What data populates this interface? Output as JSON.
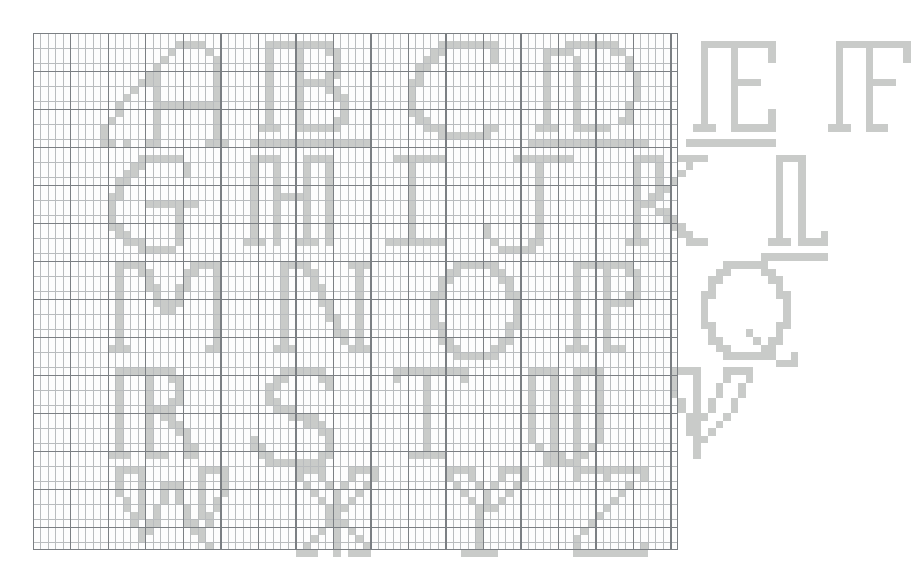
{
  "document": {
    "kind": "filet-crochet-alphabet-chart",
    "title": "Alphabet Chart A-Z",
    "description": "Graph-paper chart of decorative serif capital letters A through Z laid out in five rows",
    "paper_color": "#ffffff",
    "grid_background": "#fdfdfd",
    "minor_line_color": "#b9bcbe",
    "major_line_color": "#7b7f83",
    "filled_cell_color": "#c9cbc9",
    "cell_width_px": 7.5,
    "cell_height_px": 7.6,
    "major_every_n_cells": 5,
    "columns": 86,
    "rows": 68,
    "grid_origin": {
      "x": 33,
      "y": 33
    },
    "grid_size": {
      "width": 645,
      "height": 517
    }
  },
  "alphabet": {
    "letters": [
      "A",
      "B",
      "C",
      "D",
      "E",
      "F",
      "G",
      "H",
      "I",
      "J",
      "K",
      "L",
      "M",
      "N",
      "O",
      "P",
      "Q",
      "R",
      "S",
      "T",
      "U",
      "V",
      "W",
      "X",
      "Y",
      "Z"
    ],
    "rows": [
      {
        "index": 1,
        "letters": [
          "A",
          "B",
          "C",
          "D",
          "E",
          "F"
        ]
      },
      {
        "index": 2,
        "letters": [
          "G",
          "H",
          "I",
          "J",
          "K",
          "L"
        ]
      },
      {
        "index": 3,
        "letters": [
          "M",
          "N",
          "O",
          "P",
          "Q"
        ]
      },
      {
        "index": 4,
        "letters": [
          "R",
          "S",
          "T",
          "U",
          "V"
        ]
      },
      {
        "index": 5,
        "letters": [
          "W",
          "X",
          "Y",
          "Z"
        ]
      }
    ]
  },
  "glyphs": [
    {
      "char": "A",
      "row": 1,
      "col": 9,
      "top": 1,
      "pattern": [
        "..........####...",
        ".........#....#..",
        "........#......#.",
        ".......#.......#.",
        "......##.......#.",
        ".....###.......#.",
        "....#..#.......#.",
        "...#...#.......#.",
        "..#....#########.",
        "..#....#.......#.",
        ".#.....#.......#.",
        "#......#.......#.",
        "#......#.......#.",
        "##.#..##......###"
      ]
    },
    {
      "char": "B",
      "row": 1,
      "col": 29,
      "top": 1,
      "pattern": [
        "..#########.....",
        "..#...#...##....",
        "..#...#....#....",
        "..#...#....#....",
        "..#...#...##....",
        "..#...#####.....",
        "..#...#...##....",
        "..#...#....##...",
        "..#...#.....#...",
        "..#...#.....#...",
        "..#...#....##...",
        ".###..######....",
        "................",
        "################"
      ]
    },
    {
      "char": "C",
      "row": 1,
      "col": 49,
      "top": 1,
      "pattern": [
        ".....########",
        "....##......#",
        "...##.......#",
        "..##.........",
        "..#..........",
        ".##..........",
        ".#...........",
        ".#...........",
        ".#...........",
        ".##..........",
        "..##.........",
        "...###.....##",
        ".....#######.",
        "............."
      ]
    },
    {
      "char": "D",
      "row": 1,
      "col": 66,
      "top": 1,
      "pattern": [
        ".....#######....",
        "..####.....##...",
        "..#...#......#..",
        "..#...#......#..",
        "..#...#.......#.",
        "..#...#.......#.",
        "..#...#.......#.",
        "..#...#.......#.",
        "..#...#......#..",
        "..#...#......#..",
        "..#...#.....##..",
        ".###..#####.....",
        "................",
        "################"
      ]
    },
    {
      "char": "E",
      "row": 1,
      "col": 87,
      "top": 1,
      "pattern": [
        "..##########",
        "..#...#....#",
        "..#...#....#",
        "..#...#.....",
        "..#...#.....",
        "..#...####..",
        "..#...#.....",
        "..#...#.....",
        "..#...#.....",
        "..#...#....#",
        "..#...#....#",
        ".###..######",
        "............",
        "############"
      ]
    },
    {
      "char": "F",
      "row": 1,
      "col": 105,
      "top": 1,
      "pattern": [
        "..##########",
        "..#...#....#",
        "..#...#....#",
        "..#...#.....",
        "..#...#.....",
        "..#...####..",
        "..#...#.....",
        "..#...#.....",
        "..#...#.....",
        "..#...#.....",
        "..#...#.....",
        ".###..###...",
        "............",
        "............"
      ]
    },
    {
      "char": "G",
      "row": 2,
      "col": 9,
      "top": 16,
      "pattern": [
        ".....######..",
        "....##.....#.",
        "...##......#.",
        "..##.........",
        "..#..........",
        ".##..........",
        ".#....#######",
        ".#........#..",
        ".#........#..",
        ".##.......#..",
        "..##......#..",
        "...###....#..",
        ".....#####...",
        "............."
      ]
    },
    {
      "char": "H",
      "row": 2,
      "col": 27,
      "top": 16,
      "pattern": [
        "..####...####.",
        "..#..#...#..#.",
        "..#..#...#..#.",
        "..#..#...#..#.",
        "..#..#...#..#.",
        "..#..#####..#.",
        "..#..#...#..#.",
        "..#..#...#..#.",
        "..#..#...#..#.",
        "..#..#...#..#.",
        "..#..#...#..#.",
        ".###.#..###.#.",
        "..............",
        ".............."
      ]
    },
    {
      "char": "I",
      "row": 2,
      "col": 46,
      "top": 16,
      "pattern": [
        "..#######",
        "....#....",
        "....#....",
        "....#....",
        "....#....",
        "....#....",
        "....#....",
        "....#....",
        "....#....",
        "....#....",
        "....#....",
        ".########",
        ".........",
        "........."
      ]
    },
    {
      "char": "J",
      "row": 2,
      "col": 60,
      "top": 16,
      "pattern": [
        "....########",
        ".......#....",
        ".......#....",
        ".......#....",
        ".......#....",
        ".......#....",
        ".......#....",
        ".......#....",
        ".......#....",
        "#......#....",
        "#......#....",
        ".#....##....",
        "..#####.....",
        "............"
      ]
    },
    {
      "char": "K",
      "row": 2,
      "col": 78,
      "top": 16,
      "pattern": [
        "..####..####",
        "..#..#...#..",
        "..#..#..#...",
        "..#..#.#....",
        "..#..##.....",
        "..#.##......",
        "..###.......",
        "..#..##.....",
        "..#...##....",
        "..#....##...",
        "..#.....##..",
        ".###.....###",
        "............",
        "............"
      ]
    },
    {
      "char": "L",
      "row": 2,
      "col": 97,
      "top": 16,
      "pattern": [
        "..####...",
        "..#..#...",
        "..#..#...",
        "..#..#...",
        "..#..#...",
        "..#..#...",
        "..#..#...",
        "..#..#...",
        "..#..#...",
        "..#..#...",
        "..#..#..#",
        ".###.####",
        ".........",
        "#########"
      ]
    },
    {
      "char": "M",
      "row": 3,
      "col": 9,
      "top": 30,
      "pattern": [
        "..####......####",
        "..#..##....##..#",
        "..#...#....#...#",
        "..#...##..##...#",
        "..#....#..#....#",
        "..#....####....#",
        "..#.....##.....#",
        "..#............#",
        "..#............#",
        "..#............#",
        "..#............#",
        ".###..........##",
        "................",
        "................"
      ]
    },
    {
      "char": "N",
      "row": 3,
      "col": 31,
      "top": 30,
      "pattern": [
        "..####.....###",
        "..#..##.....#.",
        "..#...#.....#.",
        "..#...##....#.",
        "..#....#....#.",
        "..#....##...#.",
        "..#.....#...#.",
        "..#.....##..#.",
        "..#......#..#.",
        "..#......##.#.",
        "..#.......#.#.",
        ".###.......###",
        "..............",
        ".............."
      ]
    },
    {
      "char": "O",
      "row": 3,
      "col": 52,
      "top": 30,
      "pattern": [
        "....######....",
        "...##....##...",
        "..##......##..",
        "..#........#..",
        ".##........##.",
        ".#..........#.",
        ".#..........#.",
        ".#..........#.",
        ".##........##.",
        "..#........#..",
        "..##......##..",
        "...##....##...",
        "....######....",
        ".............."
      ]
    },
    {
      "char": "P",
      "row": 3,
      "col": 70,
      "top": 30,
      "pattern": [
        "..########...",
        "..#...#..##..",
        "..#...#...#..",
        "..#...#...#..",
        "..#...#..##..",
        "..#...####...",
        "..#...#......",
        "..#...#......",
        "..#...#......",
        "..#...#......",
        "..#...#......",
        ".###..###....",
        ".............",
        "............."
      ]
    },
    {
      "char": "Q",
      "row": 3,
      "col": 88,
      "top": 30,
      "pattern": [
        "....######....",
        "...##....##...",
        "..##......##..",
        "..#........#..",
        ".##........##.",
        ".#..........#.",
        ".#..........#.",
        ".#..........#.",
        ".##........##.",
        "..#....#...#..",
        "..##....#.##..",
        "...##....##...",
        "....#######..#",
        "...........###"
      ]
    },
    {
      "char": "R",
      "row": 4,
      "col": 9,
      "top": 44,
      "pattern": [
        "..########...",
        "..#...#..##..",
        "..#...#...#..",
        "..#...#...#..",
        "..#...#..##..",
        "..#...####...",
        "..#...#.##...",
        "..#...#..##..",
        "..#...#...##.",
        "..#...#....#.",
        "..#...#....##",
        ".###..###..##",
        ".............",
        "............."
      ]
    },
    {
      "char": "S",
      "row": 4,
      "col": 29,
      "top": 44,
      "pattern": [
        "....######..",
        "...##....##.",
        "..##......#.",
        "..#.........",
        "..##........",
        "...###......",
        ".....####...",
        ".......###..",
        ".........##.",
        "#.........#.",
        "##........#.",
        ".##......##.",
        "..########..",
        "............"
      ]
    },
    {
      "char": "T",
      "row": 4,
      "col": 46,
      "top": 44,
      "pattern": [
        "..##########",
        "..#...#....#",
        "......#.....",
        "......#.....",
        "......#.....",
        "......#.....",
        "......#.....",
        "......#.....",
        "......#.....",
        "......#.....",
        "......#.....",
        "....#####...",
        "............",
        "............"
      ]
    },
    {
      "char": "U",
      "row": 4,
      "col": 64,
      "top": 44,
      "pattern": [
        "..####..####",
        "..#..#..#..#",
        "..#..#..#..#",
        "..#..#..#..#",
        "..#..#..#..#",
        "..#..#..#..#",
        "..#..#..#..#",
        "..#..#..#..#",
        "..#..#..#..#",
        "..#..#..#..#",
        "...#.#..#.#.",
        "....###.##..",
        "....#####...",
        "............"
      ]
    },
    {
      "char": "V",
      "row": 4,
      "col": 83,
      "top": 44,
      "pattern": [
        "..####...####",
        "..#..#...#..#",
        "..#..#..#..#.",
        "..#..#..#..#.",
        "...#.#.#..#..",
        "...#.#.#..#..",
        "....###..#...",
        "....##..#....",
        "....##.#.....",
        ".....##......",
        ".....#.......",
        ".....#.......",
        ".............",
        "............."
      ]
    },
    {
      "char": "W",
      "row": 5,
      "col": 9,
      "top": 57,
      "pattern": [
        "..####.......####",
        "..#..#.......#..#",
        "..#..#..###..#..#",
        "..#..#..#.#..#..#",
        "...#.#..#.#..#.#.",
        "...#.#.#...#.#.#.",
        "....##.#...#.##..",
        "....#.##...##.#..",
        ".....##.....##...",
        ".....#.......#...",
        "..............#..",
        ".................",
        ".................",
        "................."
      ]
    },
    {
      "char": "X",
      "row": 5,
      "col": 33,
      "top": 57,
      "pattern": [
        "..####...####",
        "..#..#...#..#",
        "...#..#.#..#.",
        "....#..#..#..",
        ".....#.#.#...",
        "......###....",
        "......##.....",
        "......###....",
        ".....#.#.#...",
        "....#..#..#..",
        "...#...#...#.",
        "..###..#.###.",
        ".............",
        "............."
      ]
    },
    {
      "char": "Y",
      "row": 5,
      "col": 53,
      "top": 57,
      "pattern": [
        "..####...####",
        "..#..#...#..#",
        "...#..#.#..#.",
        "....#..#..#..",
        ".....#.#.#...",
        "......###....",
        "......#......",
        "......#......",
        "......#......",
        "......#......",
        "......#......",
        "....#####....",
        ".............",
        "............."
      ]
    },
    {
      "char": "Z",
      "row": 5,
      "col": 70,
      "top": 57,
      "pattern": [
        "..##########",
        "..#...#....#",
        ".........#..",
        "........#...",
        ".......#....",
        "......#.....",
        ".....#......",
        "....#.......",
        "...#........",
        "..#.........",
        "..#........#",
        "..##########",
        "............",
        "............"
      ]
    }
  ]
}
